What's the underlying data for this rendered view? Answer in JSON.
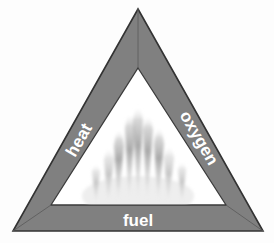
{
  "diagram": {
    "name": "fire-triangle",
    "background_color": "#fdfdfd",
    "band_color": "#808080",
    "band_color_dark": "#707070",
    "outline_color": "#333333",
    "interior_color": "#ffffff",
    "flame_color": "#9a9a9a",
    "label_color": "#ffffff",
    "edges": [
      {
        "id": "heat",
        "label": "heat",
        "position": "left",
        "rotation_deg": -60,
        "font_size": 17
      },
      {
        "id": "oxygen",
        "label": "oxygen",
        "position": "right",
        "rotation_deg": 60,
        "font_size": 17
      },
      {
        "id": "fuel",
        "label": "fuel",
        "position": "bottom",
        "rotation_deg": 0,
        "font_size": 17
      }
    ],
    "center_element": {
      "id": "flames",
      "label": "flames",
      "spike_count": 9
    },
    "geometry": {
      "outer_apex": [
        138,
        9
      ],
      "outer_left": [
        13,
        231
      ],
      "outer_right": [
        263,
        231
      ],
      "inner_apex": [
        138,
        68
      ],
      "inner_left": [
        51,
        205
      ],
      "inner_right": [
        226,
        205
      ]
    }
  }
}
